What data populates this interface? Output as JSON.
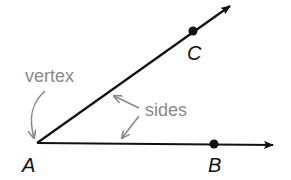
{
  "diagram": {
    "type": "angle",
    "points": {
      "vertex": {
        "label": "A"
      },
      "ray_ab_point": {
        "label": "B"
      },
      "ray_ac_point": {
        "label": "C"
      }
    },
    "annotations": {
      "vertex_label": "vertex",
      "sides_label": "sides"
    },
    "colors": {
      "line": "#111111",
      "annotation": "#8a8a8a"
    }
  }
}
